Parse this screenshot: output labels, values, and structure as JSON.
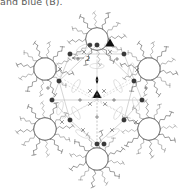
{
  "figure": {
    "kind": "crystal-packing-rosette",
    "caption_fragment": "and blue (B).",
    "width": 193,
    "height": 195,
    "background": "#ffffff",
    "center": {
      "x": 97,
      "y": 99
    },
    "symmetry": {
      "point_group_label": "6",
      "rosette_fold": 6,
      "inner_fold": 3
    },
    "colors": {
      "chain_stroke": "#6e6e6e",
      "chain_light_stroke": "#8a8a8a",
      "net_stroke": "#b9b9b9",
      "ellipse_stroke": "#cfcfcf",
      "node_fill": "#3a3a3a",
      "symbol_fill": "#111111",
      "label_text": "#3c3c3c",
      "caption_text": "#5a5a5a"
    },
    "annotations": [
      {
        "name": "two-fold-axis-label",
        "text": "2",
        "x": 88,
        "y": 60
      },
      {
        "name": "two-fold-arrow",
        "from_x": 72,
        "from_y": 58,
        "to_x": 84,
        "to_y": 58
      }
    ],
    "symmetry_symbols": [
      {
        "name": "three-fold-triangle-upper",
        "glyph": "triangle",
        "x": 110,
        "y": 44,
        "size": 7
      },
      {
        "name": "three-fold-triangle-center",
        "glyph": "triangle",
        "x": 97,
        "y": 95,
        "size": 7
      },
      {
        "name": "two-fold-lens-center",
        "glyph": "lens",
        "x": 97,
        "y": 80,
        "size": 5
      }
    ],
    "petals": [
      {
        "name": "petal-n",
        "angle_deg": 270,
        "cx": 97,
        "cy": 39
      },
      {
        "name": "petal-ne",
        "angle_deg": 330,
        "cx": 149,
        "cy": 69
      },
      {
        "name": "petal-se",
        "angle_deg": 30,
        "cx": 149,
        "cy": 129
      },
      {
        "name": "petal-s",
        "angle_deg": 90,
        "cx": 97,
        "cy": 159
      },
      {
        "name": "petal-sw",
        "angle_deg": 150,
        "cx": 45,
        "cy": 129
      },
      {
        "name": "petal-nw",
        "angle_deg": 210,
        "cx": 45,
        "cy": 69
      }
    ],
    "net_nodes": [
      {
        "name": "node-1",
        "x": 70,
        "y": 54
      },
      {
        "name": "node-2",
        "x": 97,
        "y": 45
      },
      {
        "name": "node-3",
        "x": 124,
        "y": 54
      },
      {
        "name": "node-4",
        "x": 134,
        "y": 81
      },
      {
        "name": "node-5",
        "x": 124,
        "y": 120
      },
      {
        "name": "node-6",
        "x": 97,
        "y": 144
      },
      {
        "name": "node-7",
        "x": 70,
        "y": 120
      },
      {
        "name": "node-8",
        "x": 59,
        "y": 81
      },
      {
        "name": "node-9",
        "x": 142,
        "y": 100
      },
      {
        "name": "node-10",
        "x": 52,
        "y": 100
      }
    ]
  }
}
